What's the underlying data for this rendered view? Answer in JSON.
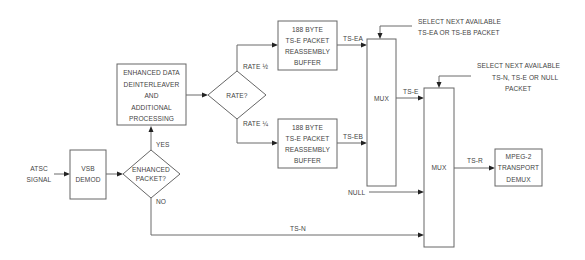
{
  "diagram": {
    "input": {
      "line1": "ATSC",
      "line2": "SIGNAL"
    },
    "vsb_demod": {
      "line1": "VSB",
      "line2": "DEMOD"
    },
    "enhanced_packet_decision": {
      "line1": "ENHANCED",
      "line2": "PACKET?",
      "yes_label": "YES",
      "no_label": "NO"
    },
    "enhanced_processing": {
      "lines": [
        "ENHANCED  DATA",
        "DEINTERLEAVER",
        "AND",
        "ADDITIONAL",
        "PROCESSING"
      ]
    },
    "rate_decision": {
      "label": "RATE?",
      "rate_half_label": "RATE  ½",
      "rate_quarter_label": "RATE  ¼"
    },
    "buffer_a": {
      "lines": [
        "188  BYTE",
        "TS-E  PACKET",
        "REASSEMBLY",
        "BUFFER"
      ],
      "output_label": "TS-EA"
    },
    "buffer_b": {
      "lines": [
        "188  BYTE",
        "TS-E  PACKET",
        "REASSEMBLY",
        "BUFFER"
      ],
      "output_label": "TS-EB"
    },
    "mux1": {
      "label": "MUX",
      "output_label": "TS-E",
      "control_note": [
        "SELECT  NEXT  AVAILABLE",
        "TS-EA  OR  TS-EB  PACKET"
      ]
    },
    "mux2": {
      "label": "MUX",
      "output_label": "TS-R",
      "control_note": [
        "SELECT  NEXT  AVAILABLE",
        "TS-N,  TS-E  OR  NULL",
        "PACKET"
      ]
    },
    "null_input": {
      "label": "NULL"
    },
    "ts_n": {
      "label": "TS-N"
    },
    "mpeg_demux": {
      "lines": [
        "MPEG-2",
        "TRANSPORT",
        "DEMUX"
      ]
    }
  }
}
